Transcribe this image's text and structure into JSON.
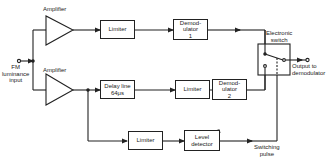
{
  "diagram": {
    "input_label": "FM\nluminance\ninput",
    "amplifier_top_label": "Amplifier",
    "amplifier_bottom_label": "Amplifier",
    "blocks": {
      "limiter_top": "Limiter",
      "demodulator_1": "Demod-\nulator\n1",
      "delay_line": "Delay line\n64μs",
      "limiter_mid": "Limiter",
      "demodulator_2": "Demod-\nulator\n2",
      "limiter_bottom": "Limiter",
      "level_detector": "Level\ndetector"
    },
    "switch_label": "Electronic\nswitch",
    "output_label": "Output to\ndemodulator",
    "switching_pulse_label": "Switching\npulse"
  },
  "colors": {
    "line": "#222222",
    "background": "#ffffff"
  }
}
